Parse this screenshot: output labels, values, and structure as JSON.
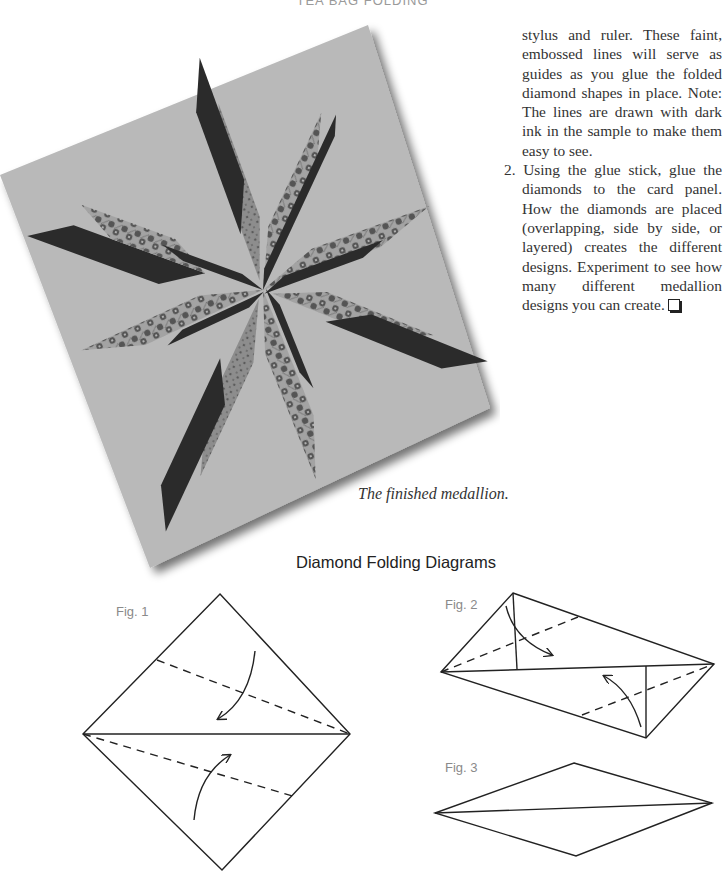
{
  "page": {
    "running_head": "TEA BAG FOLDING"
  },
  "body": {
    "paragraph_continuation": "stylus and ruler. These faint, embossed lines will serve as guides as you glue the folded diamond shapes in place. Note: The lines are drawn with dark ink in the sample to make them easy to see.",
    "step_2": "2. Using the glue stick, glue the diamonds to the card panel. How the diamonds are placed (overlapping, side by side, or layered) creates the different designs. Experiment to see how many different medallion designs you can create.",
    "end_mark_icon": "ballot-box-icon"
  },
  "photo": {
    "caption": "The finished medallion.",
    "subject": "eight-point folded diamond medallion on a square card panel"
  },
  "diagrams": {
    "section_title": "Diamond Folding Diagrams",
    "figures": [
      {
        "label": "Fig. 1",
        "description": "square turned on point, folded along horizontal diagonal; dashed fold lines with arrows"
      },
      {
        "label": "Fig. 2",
        "description": "edges folded to the center line; dashed fold lines and arrows"
      },
      {
        "label": "Fig. 3",
        "description": "finished diamond shape"
      }
    ]
  },
  "colors": {
    "card": "#b9b9b9",
    "dark_diamond": "#2b2b2b",
    "patterned_diamond": "#9a9a9a",
    "pattern_dot": "#555555",
    "line_art": "#222222",
    "fig_label": "#8a8a8a"
  }
}
